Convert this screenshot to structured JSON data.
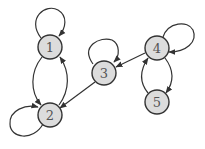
{
  "graph": {
    "type": "directed",
    "colors": {
      "node_fill": "#dcdcdc",
      "node_stroke": "#333333",
      "edge": "#333333",
      "label": "#555555",
      "background": "#ffffff"
    },
    "nodes": [
      {
        "id": "1",
        "label": "1",
        "x": 50,
        "y": 47
      },
      {
        "id": "2",
        "label": "2",
        "x": 50,
        "y": 115
      },
      {
        "id": "3",
        "label": "3",
        "x": 104,
        "y": 73
      },
      {
        "id": "4",
        "label": "4",
        "x": 157,
        "y": 48
      },
      {
        "id": "5",
        "label": "5",
        "x": 157,
        "y": 102
      }
    ],
    "edges": [
      {
        "from": "1",
        "to": "1",
        "kind": "self-loop"
      },
      {
        "from": "2",
        "to": "2",
        "kind": "self-loop"
      },
      {
        "from": "3",
        "to": "3",
        "kind": "self-loop"
      },
      {
        "from": "4",
        "to": "4",
        "kind": "self-loop"
      },
      {
        "from": "1",
        "to": "2",
        "kind": "curved-left"
      },
      {
        "from": "2",
        "to": "1",
        "kind": "curved-right"
      },
      {
        "from": "3",
        "to": "2",
        "kind": "straight"
      },
      {
        "from": "4",
        "to": "3",
        "kind": "straight"
      },
      {
        "from": "4",
        "to": "5",
        "kind": "curved-right"
      },
      {
        "from": "5",
        "to": "4",
        "kind": "curved-left"
      }
    ]
  }
}
